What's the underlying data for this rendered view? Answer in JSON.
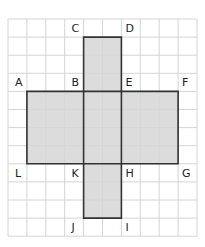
{
  "diagram": {
    "type": "net-of-cuboid",
    "grid": {
      "cols": 10,
      "rows": 12,
      "origin_x": 8,
      "origin_y": 19,
      "cell_w": 18.9,
      "cell_h": 18.1,
      "line_color": "#d4d4d4"
    },
    "shape": {
      "fill": "#d6d6d6",
      "stroke": "#333333",
      "outline_grid": [
        [
          4,
          1
        ],
        [
          6,
          1
        ],
        [
          6,
          4
        ],
        [
          9,
          4
        ],
        [
          9,
          8
        ],
        [
          6,
          8
        ],
        [
          6,
          11
        ],
        [
          4,
          11
        ],
        [
          4,
          8
        ],
        [
          1,
          8
        ],
        [
          1,
          4
        ],
        [
          4,
          4
        ]
      ],
      "inner_lines": [
        [
          [
            4,
            4
          ],
          [
            6,
            4
          ]
        ],
        [
          [
            4,
            8
          ],
          [
            6,
            8
          ]
        ],
        [
          [
            4,
            4
          ],
          [
            4,
            8
          ]
        ],
        [
          [
            6,
            4
          ],
          [
            6,
            8
          ]
        ]
      ]
    },
    "vertices": [
      {
        "name": "C",
        "gx": 4,
        "gy": 1,
        "dx": -12,
        "dy": -14
      },
      {
        "name": "D",
        "gx": 6,
        "gy": 1,
        "dx": 4,
        "dy": -14
      },
      {
        "name": "A",
        "gx": 1,
        "gy": 4,
        "dx": -12,
        "dy": -14
      },
      {
        "name": "B",
        "gx": 4,
        "gy": 4,
        "dx": -12,
        "dy": -14
      },
      {
        "name": "E",
        "gx": 6,
        "gy": 4,
        "dx": 4,
        "dy": -14
      },
      {
        "name": "F",
        "gx": 9,
        "gy": 4,
        "dx": 4,
        "dy": -14
      },
      {
        "name": "L",
        "gx": 1,
        "gy": 8,
        "dx": -12,
        "dy": 4
      },
      {
        "name": "K",
        "gx": 4,
        "gy": 8,
        "dx": -12,
        "dy": 4
      },
      {
        "name": "H",
        "gx": 6,
        "gy": 8,
        "dx": 4,
        "dy": 4
      },
      {
        "name": "G",
        "gx": 9,
        "gy": 8,
        "dx": 4,
        "dy": 4
      },
      {
        "name": "J",
        "gx": 4,
        "gy": 11,
        "dx": -12,
        "dy": 4
      },
      {
        "name": "I",
        "gx": 6,
        "gy": 11,
        "dx": 4,
        "dy": 4
      }
    ]
  }
}
